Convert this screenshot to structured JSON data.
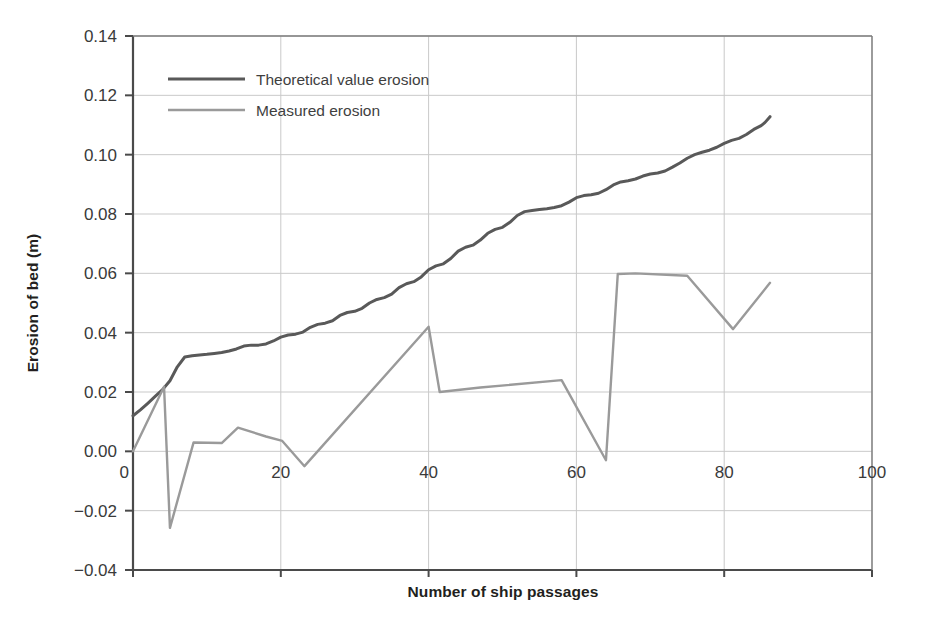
{
  "chart_data": {
    "type": "line",
    "title": "",
    "xlabel": "Number of ship passages",
    "ylabel": "Erosion of bed (m)",
    "xlim": [
      0,
      100
    ],
    "ylim": [
      -0.04,
      0.14
    ],
    "xticks": [
      0,
      20,
      40,
      60,
      80,
      100
    ],
    "xtick_labels": [
      "0",
      "20",
      "40",
      "60",
      "80",
      "100"
    ],
    "yticks": [
      -0.04,
      -0.02,
      0.0,
      0.02,
      0.04,
      0.06,
      0.08,
      0.1,
      0.12,
      0.14
    ],
    "ytick_labels": [
      "-0.04",
      "-0.02",
      "0.00",
      "0.02",
      "0.04",
      "0.06",
      "0.08",
      "0.10",
      "0.12",
      "0.14"
    ],
    "grid": true,
    "legend_position": "upper left",
    "series": [
      {
        "name": "Theoretical value erosion",
        "color": "#595959",
        "linewidth": 3.0,
        "points": [
          [
            0.0,
            0.012
          ],
          [
            1.0,
            0.014
          ],
          [
            2.0,
            0.0162
          ],
          [
            3.0,
            0.0185
          ],
          [
            4.0,
            0.0208
          ],
          [
            5.0,
            0.0238
          ],
          [
            6.0,
            0.0285
          ],
          [
            7.0,
            0.0318
          ],
          [
            8.0,
            0.0322
          ],
          [
            9.0,
            0.0325
          ],
          [
            10.0,
            0.0327
          ],
          [
            11.0,
            0.033
          ],
          [
            12.0,
            0.0333
          ],
          [
            13.0,
            0.0338
          ],
          [
            14.0,
            0.0345
          ],
          [
            15.0,
            0.0355
          ],
          [
            16.0,
            0.0358
          ],
          [
            17.0,
            0.0358
          ],
          [
            18.0,
            0.0362
          ],
          [
            19.0,
            0.0372
          ],
          [
            20.0,
            0.0385
          ],
          [
            21.0,
            0.0392
          ],
          [
            22.0,
            0.0395
          ],
          [
            23.0,
            0.0402
          ],
          [
            24.0,
            0.0418
          ],
          [
            25.0,
            0.0428
          ],
          [
            26.0,
            0.0432
          ],
          [
            27.0,
            0.044
          ],
          [
            28.0,
            0.0458
          ],
          [
            29.0,
            0.0468
          ],
          [
            30.0,
            0.0472
          ],
          [
            31.0,
            0.0482
          ],
          [
            32.0,
            0.05
          ],
          [
            33.0,
            0.0512
          ],
          [
            34.0,
            0.0518
          ],
          [
            35.0,
            0.053
          ],
          [
            36.0,
            0.0552
          ],
          [
            37.0,
            0.0565
          ],
          [
            38.0,
            0.0572
          ],
          [
            39.0,
            0.0588
          ],
          [
            40.0,
            0.0612
          ],
          [
            41.0,
            0.0625
          ],
          [
            42.0,
            0.0632
          ],
          [
            43.0,
            0.065
          ],
          [
            44.0,
            0.0675
          ],
          [
            45.0,
            0.0688
          ],
          [
            46.0,
            0.0695
          ],
          [
            47.0,
            0.0712
          ],
          [
            48.0,
            0.0735
          ],
          [
            49.0,
            0.0748
          ],
          [
            50.0,
            0.0755
          ],
          [
            51.0,
            0.0772
          ],
          [
            52.0,
            0.0795
          ],
          [
            53.0,
            0.0808
          ],
          [
            54.0,
            0.0812
          ],
          [
            55.0,
            0.0815
          ],
          [
            56.0,
            0.0818
          ],
          [
            57.0,
            0.0822
          ],
          [
            58.0,
            0.0828
          ],
          [
            59.0,
            0.084
          ],
          [
            60.0,
            0.0855
          ],
          [
            61.0,
            0.0862
          ],
          [
            62.0,
            0.0865
          ],
          [
            63.0,
            0.087
          ],
          [
            64.0,
            0.0882
          ],
          [
            65.0,
            0.0898
          ],
          [
            66.0,
            0.0908
          ],
          [
            67.0,
            0.0912
          ],
          [
            68.0,
            0.0918
          ],
          [
            69.0,
            0.0928
          ],
          [
            70.0,
            0.0935
          ],
          [
            71.0,
            0.0938
          ],
          [
            72.0,
            0.0945
          ],
          [
            73.0,
            0.0958
          ],
          [
            74.0,
            0.0972
          ],
          [
            75.0,
            0.0988
          ],
          [
            76.0,
            0.1
          ],
          [
            77.0,
            0.1008
          ],
          [
            78.0,
            0.1015
          ],
          [
            79.0,
            0.1025
          ],
          [
            80.0,
            0.1038
          ],
          [
            81.0,
            0.1048
          ],
          [
            82.0,
            0.1055
          ],
          [
            83.0,
            0.1068
          ],
          [
            84.0,
            0.1085
          ],
          [
            85.0,
            0.1098
          ],
          [
            85.5,
            0.1108
          ],
          [
            86.2,
            0.1128
          ]
        ]
      },
      {
        "name": "Measured erosion",
        "color": "#9a9a9a",
        "linewidth": 2.4,
        "points": [
          [
            0.0,
            0.0
          ],
          [
            4.2,
            0.0218
          ],
          [
            5.0,
            -0.0258
          ],
          [
            8.2,
            0.003
          ],
          [
            12.0,
            0.0028
          ],
          [
            14.2,
            0.008
          ],
          [
            18.0,
            0.005
          ],
          [
            20.2,
            0.0035
          ],
          [
            23.2,
            -0.005
          ],
          [
            40.0,
            0.042
          ],
          [
            41.5,
            0.02
          ],
          [
            47.0,
            0.0215
          ],
          [
            58.0,
            0.024
          ],
          [
            64.0,
            -0.003
          ],
          [
            65.6,
            0.0598
          ],
          [
            68.0,
            0.06
          ],
          [
            75.0,
            0.0592
          ],
          [
            81.2,
            0.0412
          ],
          [
            86.2,
            0.0568
          ]
        ]
      }
    ]
  },
  "legend": {
    "items": [
      {
        "label": "Theoretical value erosion"
      },
      {
        "label": "Measured erosion"
      }
    ]
  }
}
